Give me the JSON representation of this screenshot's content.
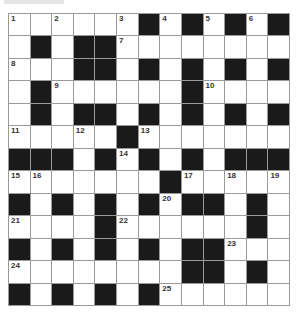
{
  "puzzle": {
    "rows": 13,
    "cols": 13,
    "colors": {
      "black": "#1a1a1a",
      "white": "#ffffff",
      "grid_line": "#9a9a9a"
    },
    "layout": [
      "WWWWWWBWBWBWB",
      "WBWBBWWWWWWWW",
      "WWWBBWBWBWBWB",
      "WBWWWWWWBWWWW",
      "WBWBBWBWBWBWB",
      "WWWWWBWWWWWWW",
      "BBBWBWBWBWBBB",
      "WWWWWWWBWWWWW",
      "BWBWBWBWBBWBW",
      "WWWWBWWWWWWBW",
      "BWBWBWBWBBWWW",
      "WWWWWWWWBBWBW",
      "BWBWBWBWWWWWW"
    ],
    "numbers": [
      {
        "r": 0,
        "c": 0,
        "n": "1"
      },
      {
        "r": 0,
        "c": 2,
        "n": "2"
      },
      {
        "r": 0,
        "c": 5,
        "n": "3"
      },
      {
        "r": 0,
        "c": 7,
        "n": "4"
      },
      {
        "r": 0,
        "c": 9,
        "n": "5"
      },
      {
        "r": 0,
        "c": 11,
        "n": "6"
      },
      {
        "r": 1,
        "c": 5,
        "n": "7"
      },
      {
        "r": 2,
        "c": 0,
        "n": "8"
      },
      {
        "r": 3,
        "c": 2,
        "n": "9"
      },
      {
        "r": 3,
        "c": 9,
        "n": "10"
      },
      {
        "r": 5,
        "c": 0,
        "n": "11"
      },
      {
        "r": 5,
        "c": 3,
        "n": "12"
      },
      {
        "r": 5,
        "c": 6,
        "n": "13"
      },
      {
        "r": 6,
        "c": 5,
        "n": "14"
      },
      {
        "r": 7,
        "c": 0,
        "n": "15"
      },
      {
        "r": 7,
        "c": 1,
        "n": "16"
      },
      {
        "r": 7,
        "c": 8,
        "n": "17"
      },
      {
        "r": 7,
        "c": 10,
        "n": "18"
      },
      {
        "r": 7,
        "c": 12,
        "n": "19"
      },
      {
        "r": 8,
        "c": 7,
        "n": "20"
      },
      {
        "r": 9,
        "c": 0,
        "n": "21"
      },
      {
        "r": 9,
        "c": 5,
        "n": "22"
      },
      {
        "r": 10,
        "c": 10,
        "n": "23"
      },
      {
        "r": 11,
        "c": 0,
        "n": "24"
      },
      {
        "r": 12,
        "c": 7,
        "n": "25"
      }
    ]
  }
}
